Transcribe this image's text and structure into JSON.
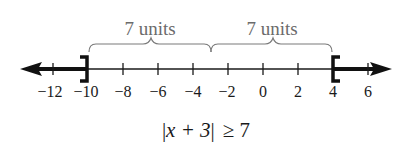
{
  "diagram": {
    "type": "number_line",
    "inequality": "|x + 3| ≥ 7",
    "inequality_parts": {
      "abs_open": "|",
      "expr": "x + 3",
      "abs_close": "|",
      "relation": "≥ 7"
    },
    "ticks": [
      {
        "value": -12,
        "label": "−12"
      },
      {
        "value": -10,
        "label": "−10"
      },
      {
        "value": -8,
        "label": "−8"
      },
      {
        "value": -6,
        "label": "−6"
      },
      {
        "value": -4,
        "label": "−4"
      },
      {
        "value": -2,
        "label": "−2"
      },
      {
        "value": 0,
        "label": "0"
      },
      {
        "value": 2,
        "label": "2"
      },
      {
        "value": 4,
        "label": "4"
      },
      {
        "value": 6,
        "label": "6"
      }
    ],
    "center": -3,
    "braces": [
      {
        "from": -10,
        "to": -3,
        "label": "7 units"
      },
      {
        "from": -3,
        "to": 4,
        "label": "7 units"
      }
    ],
    "solution": [
      {
        "from": "-infinity",
        "to": -10,
        "endpoint": "closed",
        "bracket": "]"
      },
      {
        "from": 4,
        "to": "infinity",
        "endpoint": "closed",
        "bracket": "["
      }
    ],
    "colors": {
      "line": "#1a1a1a",
      "annotation": "#6b6b6b"
    }
  }
}
